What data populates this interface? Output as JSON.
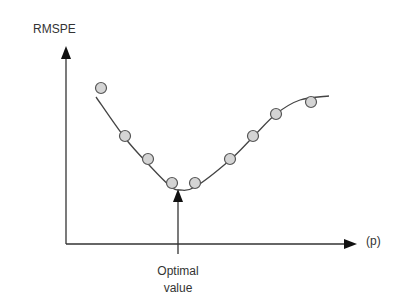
{
  "chart_data": {
    "type": "scatter",
    "title": "",
    "xlabel": "(p)",
    "ylabel": "RMSPE",
    "grid": false,
    "legend": null,
    "axis_ticks": "none",
    "series": [
      {
        "name": "observed RMSPE",
        "kind": "scatter",
        "points_px": [
          [
            101,
            88
          ],
          [
            125,
            136
          ],
          [
            148,
            159
          ],
          [
            172,
            183
          ],
          [
            195,
            183
          ],
          [
            230,
            159
          ],
          [
            253,
            136
          ],
          [
            276,
            114
          ],
          [
            311,
            102
          ]
        ]
      },
      {
        "name": "fitted curve",
        "kind": "line",
        "points_px": [
          [
            96,
            97
          ],
          [
            125,
            138
          ],
          [
            150,
            166
          ],
          [
            170,
            186
          ],
          [
            180,
            190
          ],
          [
            195,
            187
          ],
          [
            230,
            160
          ],
          [
            253,
            137
          ],
          [
            276,
            114
          ],
          [
            300,
            100
          ],
          [
            329,
            96
          ]
        ]
      }
    ],
    "annotations": [
      {
        "text_line1": "Optimal",
        "text_line2": "value",
        "arrow_x_px": 178,
        "points_to": "curve minimum"
      }
    ]
  },
  "labels": {
    "y_axis": "RMSPE",
    "x_axis": "(p)",
    "annotation_line1": "Optimal",
    "annotation_line2": "value"
  },
  "colors": {
    "axis": "#222222",
    "curve": "#444444",
    "point_fill": "#d4d4d4",
    "point_stroke": "#555555",
    "text": "#333333"
  }
}
